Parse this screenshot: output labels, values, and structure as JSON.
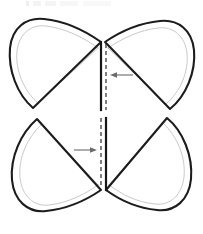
{
  "document": {
    "title": "Butterfly Pattern Piece Diagram",
    "kind": "sewing-pattern-line-drawing",
    "width": 203,
    "height": 234,
    "background_color": "#ffffff"
  },
  "top_artifact": {
    "present": true,
    "description": "faint cropped scan artifact of a cut-off text line",
    "text": ""
  },
  "colors": {
    "outline": "#1c1c1c",
    "seam_line": "#c9c9c9",
    "fold_line": "#161616",
    "dash_line": "#2b2b2b",
    "arrow": "#6b6b6b",
    "fill": "#ffffff"
  },
  "chart_data": {
    "type": "diagram",
    "xlabel": "",
    "ylabel": "",
    "xlim": [
      0,
      203
    ],
    "ylim": [
      0,
      234
    ],
    "grid": false,
    "legend": "none",
    "shapes": [
      {
        "name": "upper-left-petal",
        "role": "pattern-lobe",
        "outline_path": "M 101 42 L 33 108 L 33 108 C 17 94 8 70 10 48 C 12 28 26 17 44 19 C 64 21 84 30 101 42 Z",
        "seam_path": "M 98 48 L 38 103 C 24 91 15 70 17 51 C 19 34 31 24 46 26 C 64 28 83 37 98 48 Z",
        "bottom_edge_y": 108
      },
      {
        "name": "upper-right-petal",
        "role": "pattern-lobe",
        "outline_path": "M 105 42 L 170 109 C 186 96 196 72 194 50 C 192 30 178 19 160 21 C 140 23 121 31 105 42 Z",
        "seam_path": "M 108 48 L 166 104 C 180 92 189 72 187 53 C 185 36 173 26 158 28 C 140 30 123 38 108 48 Z",
        "bottom_edge_y": 109
      },
      {
        "name": "lower-left-petal",
        "role": "pattern-lobe",
        "outline_path": "M 101 190 L 37 119 C 21 133 10 157 12 180 C 14 201 28 213 46 211 C 66 209 85 201 101 190 Z",
        "seam_path": "M 98 185 L 42 124 C 28 137 18 157 20 178 C 22 196 34 207 49 205 C 67 203 84 195 98 185 Z",
        "top_edge_y": 119
      },
      {
        "name": "lower-right-petal",
        "role": "pattern-lobe",
        "outline_path": "M 106 190 L 167 118 C 183 131 193 156 191 179 C 189 200 175 212 157 210 C 137 208 121 201 106 190 Z",
        "seam_path": "M 109 185 L 163 123 C 177 136 186 157 184 177 C 182 195 170 206 155 204 C 136 202 123 195 109 185 Z",
        "top_edge_y": 118
      }
    ],
    "fold_lines": [
      {
        "name": "upper-fold-line",
        "style": "solid",
        "x": 101,
        "y_start": 42,
        "y_end": 110,
        "color": "#161616",
        "width": 2.2
      },
      {
        "name": "lower-fold-line",
        "style": "solid",
        "x": 106,
        "y_start": 118,
        "y_end": 190,
        "color": "#161616",
        "width": 2.2
      }
    ],
    "dashed_lines": [
      {
        "name": "upper-dashed-guide",
        "style": "dashed",
        "x": 106,
        "y_start": 44,
        "y_end": 110,
        "dash": "4 3",
        "color": "#2b2b2b"
      },
      {
        "name": "lower-dashed-guide",
        "style": "dashed",
        "x": 101,
        "y_start": 118,
        "y_end": 188,
        "dash": "4 3",
        "color": "#2b2b2b"
      }
    ],
    "arrows": [
      {
        "name": "upper-arrow",
        "direction": "left",
        "tail_x": 133,
        "head_x": 110,
        "y": 75,
        "label": ""
      },
      {
        "name": "lower-arrow",
        "direction": "right",
        "tail_x": 74,
        "head_x": 97,
        "y": 150,
        "label": ""
      }
    ],
    "annotations": [],
    "tick_labels": [],
    "legend_entries": []
  }
}
